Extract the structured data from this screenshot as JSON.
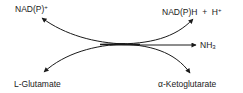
{
  "diagram": {
    "type": "reaction-scheme",
    "labels": {
      "top_left": {
        "base": "NAD(P)",
        "sup": "+"
      },
      "top_right": {
        "base": "NAD(P)H  +  H",
        "sup": "+"
      },
      "right": {
        "base": "NH",
        "sub": "3"
      },
      "bottom_left": {
        "text": "L-Glutamate"
      },
      "bottom_right": {
        "text": "α-Ketoglutarate"
      }
    },
    "arrows": [
      {
        "from": "center",
        "to": "top_left"
      },
      {
        "from": "center",
        "to": "top_right"
      },
      {
        "from": "center",
        "to": "right"
      },
      {
        "from": "center",
        "to": "bottom_left"
      },
      {
        "from": "center",
        "to": "bottom_right"
      }
    ],
    "colors": {
      "ink": "#1a1a1a",
      "background": "#ffffff"
    }
  }
}
